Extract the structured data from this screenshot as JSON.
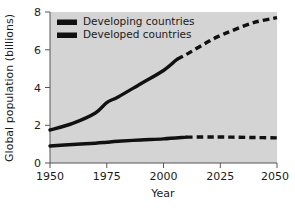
{
  "chart_data": {
    "type": "line",
    "title": "",
    "xlabel": "Year",
    "ylabel": "Global population (billions)",
    "xlim": [
      1950,
      2050
    ],
    "ylim": [
      0,
      8
    ],
    "xticks": [
      1950,
      1975,
      2000,
      2025,
      2050
    ],
    "yticks": [
      0,
      2,
      4,
      6,
      8
    ],
    "grid": false,
    "legend_position": "top-left",
    "plot_background": "#d4d4d4",
    "line_color": "#111111",
    "series": [
      {
        "name": "Developing countries",
        "style": "solid-then-dashed",
        "projection_start_year": 2006,
        "x": [
          1950,
          1960,
          1970,
          1975,
          1980,
          1990,
          2000,
          2006,
          2010,
          2020,
          2025,
          2030,
          2040,
          2050
        ],
        "values": [
          1.75,
          2.1,
          2.65,
          3.2,
          3.5,
          4.2,
          4.9,
          5.5,
          5.75,
          6.45,
          6.75,
          7.0,
          7.45,
          7.7
        ]
      },
      {
        "name": "Developed countries",
        "style": "solid-then-dashed",
        "projection_start_year": 2010,
        "x": [
          1950,
          1960,
          1970,
          1975,
          1980,
          1990,
          2000,
          2010,
          2020,
          2025,
          2030,
          2040,
          2050
        ],
        "values": [
          0.9,
          0.98,
          1.05,
          1.1,
          1.15,
          1.22,
          1.28,
          1.37,
          1.38,
          1.38,
          1.37,
          1.35,
          1.33
        ]
      }
    ]
  },
  "axes": {
    "y_title": "Global population (billions)",
    "x_title": "Year",
    "y_tick_labels": [
      "8",
      "6",
      "4",
      "2",
      "0"
    ],
    "x_tick_labels": [
      "1950",
      "1975",
      "2000",
      "2025",
      "2050"
    ]
  },
  "legend": {
    "items": [
      {
        "label": "Developing countries",
        "swatch": "legend-swatch-developing"
      },
      {
        "label": "Developed countries",
        "swatch": "legend-swatch-developed"
      }
    ]
  }
}
